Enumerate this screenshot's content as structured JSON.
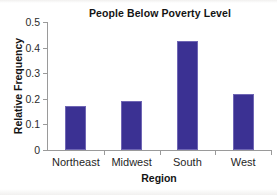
{
  "chart_data": {
    "type": "bar",
    "title": "People Below Poverty Level",
    "xlabel": "Region",
    "ylabel": "Relative Frequency",
    "categories": [
      "Northeast",
      "Midwest",
      "South",
      "West"
    ],
    "values": [
      0.17,
      0.19,
      0.425,
      0.22
    ],
    "ylim": [
      0,
      0.5
    ],
    "ytick_labels": [
      "0",
      "0.1",
      "0.2",
      "0.3",
      "0.4",
      "0.5"
    ],
    "ytick_values": [
      0,
      0.1,
      0.2,
      0.3,
      0.4,
      0.5
    ],
    "grid": false,
    "legend": "none",
    "series": [
      {
        "name": "Relative Frequency",
        "color": "#3b3193",
        "values": [
          0.17,
          0.19,
          0.425,
          0.22
        ]
      }
    ]
  },
  "colors": {
    "bar_fill": "#3b3193",
    "bar_edge": "#6f66b4",
    "axis": "#9a9a9a",
    "text": "#141414",
    "background": "#ffffff"
  }
}
